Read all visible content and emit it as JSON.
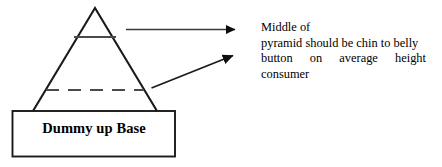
{
  "diagram": {
    "title_shape": {
      "base_box_label": "Dummy up Base"
    },
    "pyramid": {
      "apex_marker": "pyramid-apex",
      "upper_divider": "upper-shelf-line",
      "middle_divider": "middle-dashed-line"
    },
    "arrows": [
      {
        "name": "top-callout-arrow",
        "style": "solid-horizontal"
      },
      {
        "name": "middle-callout-arrow",
        "style": "solid-diagonal"
      }
    ],
    "annotation": {
      "full_text": "Middle of pyramid should be chin to belly button on average height consumer",
      "line1": "Middle of",
      "line2": "pyramid should be chin to belly",
      "line3_words": [
        "button",
        "on",
        "average",
        "height"
      ],
      "line4": "consumer"
    },
    "colors": {
      "stroke": "#1a1a1a",
      "text": "#000000",
      "background": "#ffffff"
    }
  }
}
